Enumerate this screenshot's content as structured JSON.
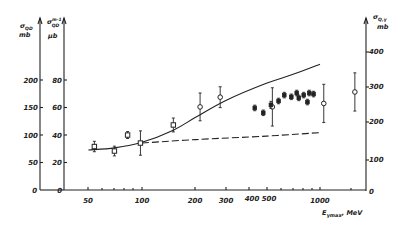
{
  "chart_data": {
    "type": "scatter",
    "title": "",
    "xlabel": "E_γmax, MeV",
    "xscale": "log",
    "xlim": [
      30,
      1600
    ],
    "x_ticks": [
      50,
      100,
      200,
      300,
      400,
      500,
      1000
    ],
    "x_tick_labels": [
      "50",
      "100",
      "200",
      "300",
      "400",
      "500",
      "1000"
    ],
    "y_axes": [
      {
        "id": "left_outer",
        "label": "σ_QD, mb",
        "ticks": [
          0,
          50,
          100,
          150,
          200
        ],
        "ylim": [
          0,
          200
        ]
      },
      {
        "id": "left_inner",
        "label": "σ^{m-1}_QD, μb",
        "ticks": [
          0,
          20,
          40,
          60,
          80
        ],
        "ylim": [
          0,
          80
        ]
      },
      {
        "id": "right",
        "label": "σ_Q,γ, mb",
        "ticks": [
          0,
          100,
          200,
          300,
          400
        ],
        "ylim": [
          0,
          400
        ]
      }
    ],
    "grid": false,
    "legend": null,
    "series": [
      {
        "name": "Calculated curve (solid)",
        "style": "solid-line",
        "axis": "right",
        "x": [
          30,
          50,
          70,
          100,
          150,
          200,
          300,
          500,
          700,
          1000,
          1400
        ],
        "y": [
          115,
          118,
          124,
          140,
          175,
          212,
          262,
          310,
          335,
          365,
          425
        ]
      },
      {
        "name": "Quasi-deuteron baseline (dashed)",
        "style": "dashed-line",
        "axis": "right",
        "x": [
          30,
          100,
          200,
          500,
          1000,
          1400
        ],
        "y": [
          115,
          138,
          148,
          158,
          168,
          172
        ]
      },
      {
        "name": "Open squares",
        "style": "open-square",
        "axis": "right",
        "x": [
          54,
          70,
          83,
          98,
          150
        ],
        "y": [
          128,
          115,
          161,
          138,
          190
        ],
        "yerr": [
          15,
          14,
          10,
          35,
          20
        ]
      },
      {
        "name": "Open circles",
        "style": "open-circle",
        "axis": "right",
        "x": [
          212,
          275,
          540,
          1050,
          1570
        ],
        "y": [
          242,
          270,
          242,
          252,
          285
        ],
        "yerr": [
          40,
          30,
          55,
          55,
          55
        ]
      },
      {
        "name": "Filled points",
        "style": "filled-diamond",
        "axis": "right",
        "x": [
          430,
          480,
          530,
          585,
          630,
          690,
          740,
          760,
          810,
          850,
          870,
          920
        ],
        "y": [
          239,
          225,
          248,
          259,
          276,
          271,
          282,
          268,
          276,
          256,
          282,
          279
        ],
        "yerr": [
          8,
          8,
          10,
          8,
          8,
          8,
          8,
          8,
          8,
          8,
          8,
          8
        ]
      }
    ]
  },
  "axes": {
    "left_outer": {
      "title_line1": "σ",
      "title_sub": "QD",
      "title_unit": "mb",
      "ticks": [
        "0",
        "50",
        "100",
        "150",
        "200"
      ]
    },
    "left_inner": {
      "title_line1": "σ",
      "title_sup": "m-1",
      "title_sub": "QD",
      "title_unit": "μb",
      "ticks": [
        "0",
        "20",
        "40",
        "60",
        "80"
      ]
    },
    "right": {
      "title_line1": "σ",
      "title_sub": "Q,γ",
      "title_unit": "mb",
      "ticks": [
        "0",
        "100",
        "200",
        "300",
        "400"
      ]
    },
    "x": {
      "ticks": [
        "50",
        "100",
        "200",
        "300",
        "400",
        "500",
        "1000"
      ],
      "title_main": "E",
      "title_sub": "γmax",
      "title_unit": ", MeV"
    }
  }
}
